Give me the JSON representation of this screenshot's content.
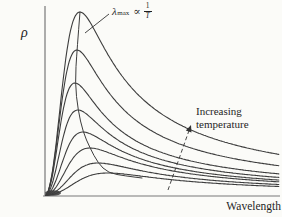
{
  "figure": {
    "ylabel": "ρ",
    "xlabel": "Wavelength",
    "lambda_annotation": {
      "symbol": "λ",
      "subscript": "max",
      "proportional": "∝",
      "numerator": "1",
      "denominator": "T"
    },
    "temp_annotation": {
      "line1": "Increasing",
      "line2": "temperature"
    }
  },
  "colors": {
    "background": "#fbfbf8",
    "curve": "#3d3d3d",
    "axis": "#787878",
    "text": "#1f1f1f",
    "annotation_line": "#333333"
  },
  "chart_data": {
    "type": "line",
    "xlabel": "Wavelength",
    "ylabel": "ρ",
    "grid": false,
    "legend": "none",
    "axis_tick_labels": "none (qualitative axes)",
    "model": "rho(u) = 1.5*h * u^2/(0.5+u^3), u = lambda/lambda_max; qualitative Planck-like curves, peak height h grows and lambda_max shrinks as temperature rises",
    "axes": {
      "y_x": 45,
      "y_top": 6,
      "y_bottom": 196,
      "x_y": 196,
      "x_left": 43,
      "x_right": 280,
      "lambda_span_px": 234,
      "baseline_y": 195.5
    },
    "curves": [
      {
        "relative_temperature": 1.0,
        "peak_x_px": 80,
        "peak_y_px": 12
      },
      {
        "relative_temperature": 0.955,
        "peak_x_px": 77,
        "peak_y_px": 50
      },
      {
        "relative_temperature": 0.907,
        "peak_x_px": 75,
        "peak_y_px": 83
      },
      {
        "relative_temperature": 0.859,
        "peak_x_px": 78,
        "peak_y_px": 110
      },
      {
        "relative_temperature": 0.81,
        "peak_x_px": 83,
        "peak_y_px": 132
      },
      {
        "relative_temperature": 0.764,
        "peak_x_px": 90,
        "peak_y_px": 148
      },
      {
        "relative_temperature": 0.709,
        "peak_x_px": 98,
        "peak_y_px": 163
      },
      {
        "relative_temperature": 0.66,
        "peak_x_px": 108,
        "peak_y_px": 173
      }
    ],
    "locus_tail_points": [
      [
        126,
        176
      ],
      [
        142,
        178
      ]
    ],
    "pointer_line": {
      "from": [
        109,
        14
      ],
      "to": [
        85,
        33
      ]
    },
    "dashed_arrow": {
      "from": [
        168,
        190
      ],
      "to": [
        191,
        125
      ]
    },
    "origin_blob": {
      "cx": 53,
      "cy": 193,
      "rx": 8,
      "ry": 2.8
    }
  }
}
